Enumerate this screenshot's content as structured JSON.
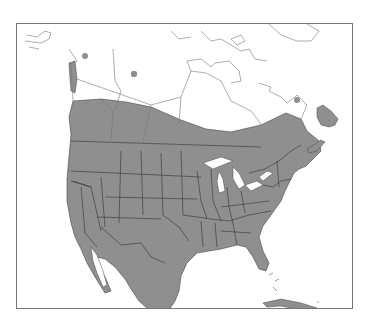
{
  "map": {
    "type": "range map",
    "region": "North America",
    "colors": {
      "range_fill": "#8f8f8f",
      "border_line": "#333333",
      "outline_line": "#777777",
      "water": "#ffffff",
      "land": "#ffffff",
      "frame": "#777777"
    },
    "legend": [],
    "range_description": "Shaded breeding/resident range covering contiguous United States, southern Canada, Maritimes, Newfoundland and Mexico; isolated dots in Yukon, Northwest Territories and Labrador",
    "isolated_points": [
      {
        "name": "yukon-dot",
        "x": 84,
        "y": 55
      },
      {
        "name": "nwt-dot",
        "x": 133,
        "y": 73
      },
      {
        "name": "labrador-dot",
        "x": 296,
        "y": 99
      }
    ]
  }
}
